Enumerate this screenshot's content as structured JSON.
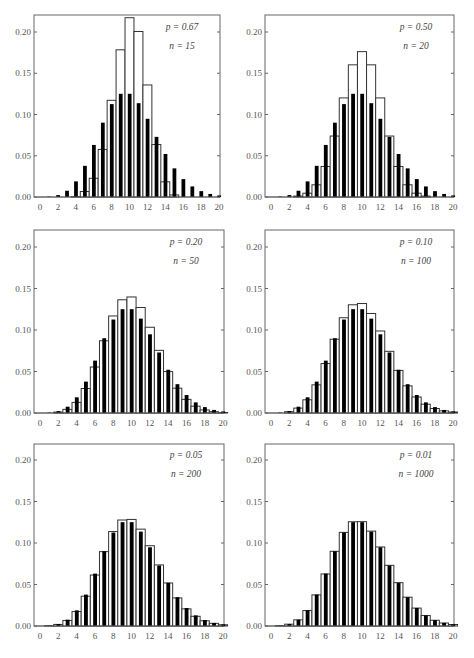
{
  "chart_data": [
    {
      "type": "bar",
      "title": "",
      "annotation": {
        "p": "p = 0.67",
        "n": "n = 15"
      },
      "xlabel": "",
      "ylabel": "",
      "xlim": [
        0,
        20
      ],
      "ylim": [
        0,
        0.22
      ],
      "xticks": [
        "0",
        "2",
        "4",
        "6",
        "8",
        "10",
        "12",
        "14",
        "16",
        "18",
        "20"
      ],
      "yticks": [
        "0.00",
        "0.05",
        "0.10",
        "0.15",
        "0.20"
      ],
      "categories": [
        0,
        1,
        2,
        3,
        4,
        5,
        6,
        7,
        8,
        9,
        10,
        11,
        12,
        13,
        14,
        15,
        16,
        17,
        18,
        19,
        20
      ],
      "series": [
        {
          "name": "Binomial",
          "style": "open",
          "values": [
            0,
            0,
            0,
            0,
            0.0005,
            0.0067,
            0.0227,
            0.0577,
            0.1172,
            0.1784,
            0.2173,
            0.2006,
            0.1358,
            0.0636,
            0.0184,
            0.0025,
            0,
            0,
            0,
            0,
            0
          ]
        },
        {
          "name": "Poisson (mean 10)",
          "style": "filled",
          "values": [
            0,
            0.0005,
            0.0023,
            0.0076,
            0.0189,
            0.0378,
            0.0631,
            0.0901,
            0.1126,
            0.1251,
            0.1251,
            0.1137,
            0.0948,
            0.0729,
            0.0521,
            0.0347,
            0.0217,
            0.0128,
            0.0071,
            0.0037,
            0.0019
          ]
        }
      ]
    },
    {
      "type": "bar",
      "title": "",
      "annotation": {
        "p": "p = 0.50",
        "n": "n = 20"
      },
      "xlabel": "",
      "ylabel": "",
      "xlim": [
        0,
        20
      ],
      "ylim": [
        0,
        0.22
      ],
      "xticks": [
        "0",
        "2",
        "4",
        "6",
        "8",
        "10",
        "12",
        "14",
        "16",
        "18",
        "20"
      ],
      "yticks": [
        "0.00",
        "0.05",
        "0.10",
        "0.15",
        "0.20"
      ],
      "categories": [
        0,
        1,
        2,
        3,
        4,
        5,
        6,
        7,
        8,
        9,
        10,
        11,
        12,
        13,
        14,
        15,
        16,
        17,
        18,
        19,
        20
      ],
      "series": [
        {
          "name": "Binomial",
          "style": "open",
          "values": [
            0,
            0,
            0.0002,
            0.0011,
            0.0046,
            0.0148,
            0.037,
            0.0739,
            0.1201,
            0.1602,
            0.1762,
            0.1602,
            0.1201,
            0.0739,
            0.037,
            0.0148,
            0.0046,
            0.0011,
            0.0002,
            0,
            0
          ]
        },
        {
          "name": "Poisson (mean 10)",
          "style": "filled",
          "values": [
            0,
            0.0005,
            0.0023,
            0.0076,
            0.0189,
            0.0378,
            0.0631,
            0.0901,
            0.1126,
            0.1251,
            0.1251,
            0.1137,
            0.0948,
            0.0729,
            0.0521,
            0.0347,
            0.0217,
            0.0128,
            0.0071,
            0.0037,
            0.0019
          ]
        }
      ]
    },
    {
      "type": "bar",
      "title": "",
      "annotation": {
        "p": "p = 0.20",
        "n": "n = 50"
      },
      "xlabel": "",
      "ylabel": "",
      "xlim": [
        0,
        20
      ],
      "ylim": [
        0,
        0.22
      ],
      "xticks": [
        "0",
        "2",
        "4",
        "6",
        "8",
        "10",
        "12",
        "14",
        "16",
        "18",
        "20"
      ],
      "yticks": [
        "0.00",
        "0.05",
        "0.10",
        "0.15",
        "0.20"
      ],
      "categories": [
        0,
        1,
        2,
        3,
        4,
        5,
        6,
        7,
        8,
        9,
        10,
        11,
        12,
        13,
        14,
        15,
        16,
        17,
        18,
        19,
        20
      ],
      "series": [
        {
          "name": "Binomial",
          "style": "open",
          "values": [
            0,
            0.0002,
            0.0011,
            0.0044,
            0.0128,
            0.0295,
            0.0554,
            0.087,
            0.1169,
            0.1364,
            0.1398,
            0.1271,
            0.1033,
            0.0755,
            0.0499,
            0.0299,
            0.0164,
            0.0082,
            0.0037,
            0.0016,
            0.0006
          ]
        },
        {
          "name": "Poisson (mean 10)",
          "style": "filled",
          "values": [
            0,
            0.0005,
            0.0023,
            0.0076,
            0.0189,
            0.0378,
            0.0631,
            0.0901,
            0.1126,
            0.1251,
            0.1251,
            0.1137,
            0.0948,
            0.0729,
            0.0521,
            0.0347,
            0.0217,
            0.0128,
            0.0071,
            0.0037,
            0.0019
          ]
        }
      ]
    },
    {
      "type": "bar",
      "title": "",
      "annotation": {
        "p": "p = 0.10",
        "n": "n = 100"
      },
      "xlabel": "",
      "ylabel": "",
      "xlim": [
        0,
        20
      ],
      "ylim": [
        0,
        0.22
      ],
      "xticks": [
        "0",
        "2",
        "4",
        "6",
        "8",
        "10",
        "12",
        "14",
        "16",
        "18",
        "20"
      ],
      "yticks": [
        "0.00",
        "0.05",
        "0.10",
        "0.15",
        "0.20"
      ],
      "categories": [
        0,
        1,
        2,
        3,
        4,
        5,
        6,
        7,
        8,
        9,
        10,
        11,
        12,
        13,
        14,
        15,
        16,
        17,
        18,
        19,
        20
      ],
      "series": [
        {
          "name": "Binomial",
          "style": "open",
          "values": [
            0,
            0.0003,
            0.0016,
            0.0059,
            0.0159,
            0.0339,
            0.0596,
            0.0889,
            0.1148,
            0.1304,
            0.1319,
            0.1199,
            0.0988,
            0.0743,
            0.0513,
            0.0327,
            0.0193,
            0.0106,
            0.0054,
            0.0026,
            0.0012
          ]
        },
        {
          "name": "Poisson (mean 10)",
          "style": "filled",
          "values": [
            0,
            0.0005,
            0.0023,
            0.0076,
            0.0189,
            0.0378,
            0.0631,
            0.0901,
            0.1126,
            0.1251,
            0.1251,
            0.1137,
            0.0948,
            0.0729,
            0.0521,
            0.0347,
            0.0217,
            0.0128,
            0.0071,
            0.0037,
            0.0019
          ]
        }
      ]
    },
    {
      "type": "bar",
      "title": "",
      "annotation": {
        "p": "p = 0.05",
        "n": "n = 200"
      },
      "xlabel": "",
      "ylabel": "",
      "xlim": [
        0,
        20
      ],
      "ylim": [
        0,
        0.22
      ],
      "xticks": [
        "0",
        "2",
        "4",
        "6",
        "8",
        "10",
        "12",
        "14",
        "16",
        "18",
        "20"
      ],
      "yticks": [
        "0.00",
        "0.05",
        "0.10",
        "0.15",
        "0.20"
      ],
      "categories": [
        0,
        1,
        2,
        3,
        4,
        5,
        6,
        7,
        8,
        9,
        10,
        11,
        12,
        13,
        14,
        15,
        16,
        17,
        18,
        19,
        20
      ],
      "series": [
        {
          "name": "Binomial",
          "style": "open",
          "values": [
            0,
            0.0004,
            0.0019,
            0.0067,
            0.0174,
            0.0359,
            0.0614,
            0.0896,
            0.1138,
            0.1277,
            0.1284,
            0.1167,
            0.0967,
            0.0736,
            0.0518,
            0.0338,
            0.0206,
            0.0117,
            0.0063,
            0.0032,
            0.0015
          ]
        },
        {
          "name": "Poisson (mean 10)",
          "style": "filled",
          "values": [
            0,
            0.0005,
            0.0023,
            0.0076,
            0.0189,
            0.0378,
            0.0631,
            0.0901,
            0.1126,
            0.1251,
            0.1251,
            0.1137,
            0.0948,
            0.0729,
            0.0521,
            0.0347,
            0.0217,
            0.0128,
            0.0071,
            0.0037,
            0.0019
          ]
        }
      ]
    },
    {
      "type": "bar",
      "title": "",
      "annotation": {
        "p": "p = 0.01",
        "n": "n = 1000"
      },
      "xlabel": "",
      "ylabel": "",
      "xlim": [
        0,
        20
      ],
      "ylim": [
        0,
        0.22
      ],
      "xticks": [
        "0",
        "2",
        "4",
        "6",
        "8",
        "10",
        "12",
        "14",
        "16",
        "18",
        "20"
      ],
      "yticks": [
        "0.00",
        "0.05",
        "0.10",
        "0.15",
        "0.20"
      ],
      "categories": [
        0,
        1,
        2,
        3,
        4,
        5,
        6,
        7,
        8,
        9,
        10,
        11,
        12,
        13,
        14,
        15,
        16,
        17,
        18,
        19,
        20
      ],
      "series": [
        {
          "name": "Binomial",
          "style": "open",
          "values": [
            0,
            0.0004,
            0.0022,
            0.0074,
            0.0186,
            0.0375,
            0.0627,
            0.09,
            0.1128,
            0.1256,
            0.1257,
            0.1143,
            0.0952,
            0.0731,
            0.0522,
            0.0347,
            0.0216,
            0.0126,
            0.0069,
            0.0036,
            0.0018
          ]
        },
        {
          "name": "Poisson (mean 10)",
          "style": "filled",
          "values": [
            0,
            0.0005,
            0.0023,
            0.0076,
            0.0189,
            0.0378,
            0.0631,
            0.0901,
            0.1126,
            0.1251,
            0.1251,
            0.1137,
            0.0948,
            0.0729,
            0.0521,
            0.0347,
            0.0217,
            0.0128,
            0.0071,
            0.0037,
            0.0019
          ]
        }
      ]
    }
  ],
  "layout": {
    "panels": [
      {
        "left": 34,
        "right": 220,
        "top": 15,
        "zero_y": 197,
        "y020": 32
      },
      {
        "left": 265,
        "right": 454,
        "top": 15,
        "zero_y": 197,
        "y020": 32
      },
      {
        "left": 34,
        "right": 224,
        "top": 230,
        "zero_y": 413,
        "y020": 247
      },
      {
        "left": 265,
        "right": 454,
        "top": 230,
        "zero_y": 413,
        "y020": 247
      },
      {
        "left": 34,
        "right": 224,
        "top": 444,
        "zero_y": 626,
        "y020": 460
      },
      {
        "left": 265,
        "right": 454,
        "top": 444,
        "zero_y": 626,
        "y020": 460
      }
    ],
    "colors": {
      "axis": "#666666",
      "filled_bar": "#000000",
      "open_bar_stroke": "#333333",
      "text": "#555555"
    }
  }
}
